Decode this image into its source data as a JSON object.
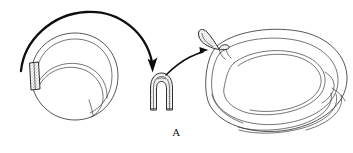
{
  "figure": {
    "panel_label": "A",
    "caption_text": "",
    "background_color": "#ffffff",
    "ink_color": "#1a1a1a",
    "stipple_color": "#6e6e6e",
    "type": "line-art-medical-illustration"
  },
  "elements": {
    "left_structure": {
      "name": "donor ring structure",
      "label": "",
      "graft_segment_label": "",
      "shading": "stippled"
    },
    "middle_structure": {
      "name": "folded U-shaped graft",
      "label": "",
      "shading": "stippled"
    },
    "right_structure": {
      "name": "recipient ring structure with inset graft loop",
      "label": "",
      "shading": "stippled"
    },
    "arrow_one": {
      "name": "harvest transfer arrow",
      "label": ""
    },
    "arrow_two": {
      "name": "insertion transfer arrow",
      "label": ""
    }
  }
}
